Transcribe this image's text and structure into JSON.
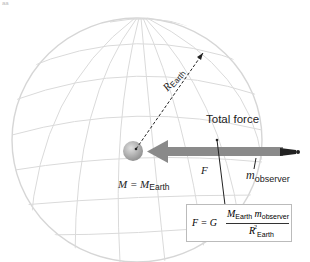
{
  "figure": {
    "corner_mark": "aa",
    "labels": {
      "total_force": "Total force",
      "force_symbol": "F",
      "observer_mass_main": "m",
      "observer_mass_sub": "observer",
      "earth_mass_main": "M = M",
      "earth_mass_sub": "Earth",
      "radius_main": "R",
      "radius_sub": "Earth"
    },
    "formula": {
      "lhs": "F = G",
      "num_M": "M",
      "num_M_sub": "Earth",
      "num_m": " m",
      "num_m_sub": "observer",
      "den_R": "R",
      "den_sup": "2",
      "den_sub": "Earth"
    },
    "colors": {
      "grid": "#d8d8d8",
      "arrow": "#8a8a8a",
      "core": "#9a9a9a",
      "ink": "#222222"
    }
  }
}
